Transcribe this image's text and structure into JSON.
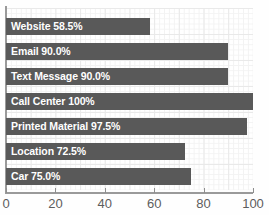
{
  "chart_data": {
    "type": "bar",
    "orientation": "horizontal",
    "title": "",
    "xlabel": "",
    "ylabel": "",
    "xlim": [
      0,
      100
    ],
    "xticks": [
      0,
      20,
      40,
      60,
      80,
      100
    ],
    "xtick_labels": [
      "0",
      "20",
      "40",
      "60",
      "80",
      "100"
    ],
    "grid": true,
    "legend": "none",
    "bar_color": "#595959",
    "label_color": "#ffffff",
    "grid_color": "#e9e9e9",
    "axis_color": "#9a9a9a",
    "categories": [
      "Website",
      "Email",
      "Text Message",
      "Call Center",
      "Printed Material",
      "Location",
      "Car"
    ],
    "values": [
      58.5,
      90.0,
      90.0,
      100,
      97.5,
      72.5,
      75.0
    ],
    "bars": [
      {
        "category": "Website",
        "value": 58.5,
        "label": "Website 58.5%"
      },
      {
        "category": "Email",
        "value": 90.0,
        "label": "Email 90.0%"
      },
      {
        "category": "Text Message",
        "value": 90.0,
        "label": "Text Message 90.0%"
      },
      {
        "category": "Call Center",
        "value": 100,
        "label": "Call Center 100%"
      },
      {
        "category": "Printed Material",
        "value": 97.5,
        "label": "Printed Material 97.5%"
      },
      {
        "category": "Location",
        "value": 72.5,
        "label": "Location 72.5%"
      },
      {
        "category": "Car",
        "value": 75.0,
        "label": "Car 75.0%"
      }
    ]
  }
}
